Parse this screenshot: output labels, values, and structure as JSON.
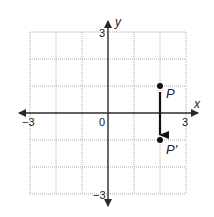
{
  "diagram": {
    "type": "coordinate-plane-translation",
    "x_range": [
      -3,
      3
    ],
    "y_range": [
      -3,
      3
    ],
    "grid_step": 1,
    "axis_labels": {
      "x": "x",
      "y": "y"
    },
    "tick_labels": {
      "x_min": "−3",
      "x_max": "3",
      "y_max": "3",
      "y_min": "−3",
      "origin": "0"
    },
    "points": [
      {
        "label": "P",
        "x": 2,
        "y": 1
      },
      {
        "label": "P′",
        "x": 2,
        "y": -1
      }
    ],
    "arrow": {
      "from": "P",
      "to": "P′",
      "description": "translation down 2 units"
    }
  }
}
